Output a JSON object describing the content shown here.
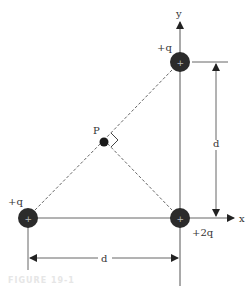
{
  "diagram": {
    "axes": {
      "x_label": "x",
      "y_label": "y"
    },
    "charges": [
      {
        "id": "top",
        "label": "+q",
        "symbol": "+"
      },
      {
        "id": "left",
        "label": "+q",
        "symbol": "+"
      },
      {
        "id": "origin",
        "label": "+2q",
        "symbol": "+"
      }
    ],
    "point": {
      "label": "P"
    },
    "dimensions": {
      "vertical": "d",
      "horizontal": "d"
    },
    "caption": "FIGURE 19-1"
  }
}
